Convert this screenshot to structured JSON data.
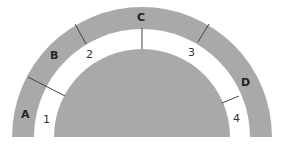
{
  "diagram": {
    "type": "concentric-semicircle",
    "colors": {
      "fill": "#a9a9a9",
      "divider": "#444444",
      "background": "#ffffff"
    },
    "outer_ring": {
      "segments": [
        {
          "label": "A"
        },
        {
          "label": "B"
        },
        {
          "label": "C"
        },
        {
          "label": "D"
        }
      ]
    },
    "gap_band": {
      "numbers": [
        "1",
        "2",
        "3",
        "4"
      ]
    }
  }
}
